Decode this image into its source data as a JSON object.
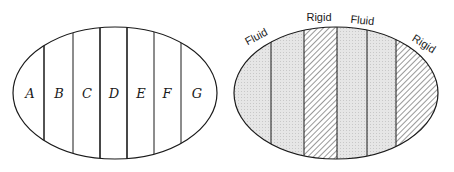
{
  "left_diagram": {
    "regions": [
      "A",
      "B",
      "C",
      "D",
      "E",
      "F",
      "G"
    ]
  },
  "right_diagram": {
    "labels": [
      {
        "text": "Fluid"
      },
      {
        "text": "Rigid"
      },
      {
        "text": "Fluid"
      },
      {
        "text": "Rigid"
      }
    ]
  },
  "colors": {
    "stroke": "#1a1a1a",
    "fluid_fill": "#e3e3e3",
    "background": "#ffffff"
  }
}
